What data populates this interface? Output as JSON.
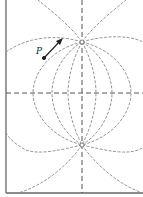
{
  "diagram": {
    "point_label": "P",
    "charges": [
      {
        "name": "upper-charge",
        "x": 82,
        "y": 42
      },
      {
        "name": "lower-charge",
        "x": 82,
        "y": 145
      }
    ],
    "colors": {
      "field_line": "#8a8a8a",
      "axis": "#555555",
      "frame": "#666666",
      "arrow": "#222222"
    }
  }
}
